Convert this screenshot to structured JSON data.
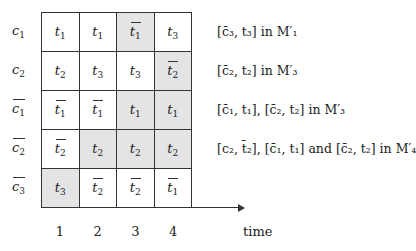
{
  "diagram": {
    "rows": [
      {
        "label": "c",
        "label_sub": "1",
        "label_bar": false,
        "top": 12,
        "cells": [
          {
            "t": "1",
            "bar": false,
            "shaded": false
          },
          {
            "t": "1",
            "bar": false,
            "shaded": false
          },
          {
            "t": "1",
            "bar": true,
            "shaded": true
          },
          {
            "t": "3",
            "bar": false,
            "shaded": false
          }
        ],
        "annotation": "[c̄₃, t₃] in M′₁"
      },
      {
        "label": "c",
        "label_sub": "2",
        "label_bar": false,
        "top": 51,
        "cells": [
          {
            "t": "2",
            "bar": false,
            "shaded": false
          },
          {
            "t": "3",
            "bar": false,
            "shaded": false
          },
          {
            "t": "3",
            "bar": false,
            "shaded": false
          },
          {
            "t": "2",
            "bar": true,
            "shaded": true
          }
        ],
        "annotation": "[c̄₂, t₂] in M′₃"
      },
      {
        "label": "c",
        "label_sub": "1",
        "label_bar": true,
        "top": 90,
        "cells": [
          {
            "t": "1",
            "bar": true,
            "shaded": false
          },
          {
            "t": "1",
            "bar": true,
            "shaded": false
          },
          {
            "t": "1",
            "bar": false,
            "shaded": true
          },
          {
            "t": "1",
            "bar": false,
            "shaded": true
          }
        ],
        "annotation": "[c̄₁, t₁], [c̄₂, t₂] in M′₃"
      },
      {
        "label": "c",
        "label_sub": "2",
        "label_bar": true,
        "top": 129,
        "cells": [
          {
            "t": "2",
            "bar": true,
            "shaded": false
          },
          {
            "t": "2",
            "bar": false,
            "shaded": true
          },
          {
            "t": "2",
            "bar": false,
            "shaded": true
          },
          {
            "t": "2",
            "bar": false,
            "shaded": true
          }
        ],
        "annotation": "[c₂, t̄₂], [c̄₁, t₁] and [c̄₂, t₂] in M′₄"
      },
      {
        "label": "c",
        "label_sub": "3",
        "label_bar": true,
        "top": 168,
        "cells": [
          {
            "t": "3",
            "bar": false,
            "shaded": true
          },
          {
            "t": "2",
            "bar": true,
            "shaded": false
          },
          {
            "t": "2",
            "bar": true,
            "shaded": false
          },
          {
            "t": "1",
            "bar": true,
            "shaded": false
          }
        ],
        "annotation": ""
      }
    ],
    "columns": [
      "1",
      "2",
      "3",
      "4"
    ],
    "axis_label": "time",
    "cell_var": "t",
    "shade_color": "#e4e4e4"
  }
}
